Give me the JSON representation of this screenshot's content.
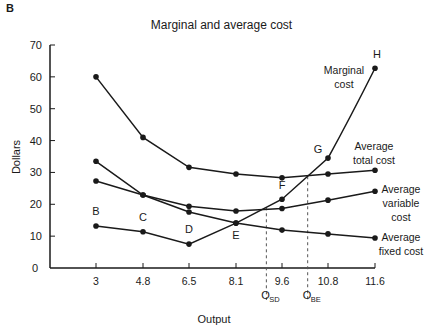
{
  "panel_label": "B",
  "chart_data": {
    "type": "line",
    "title": "Marginal and average cost",
    "xlabel": "Output",
    "ylabel": "Dollars",
    "categories": [
      "3",
      "4.8",
      "6.5",
      "8.1",
      "9.6",
      "10.8",
      "11.6"
    ],
    "x": [
      3,
      4.8,
      6.5,
      8.1,
      9.6,
      10.8,
      11.6
    ],
    "ylim": [
      0,
      70
    ],
    "yticks": [
      0,
      10,
      20,
      30,
      40,
      50,
      60,
      70
    ],
    "grid": false,
    "legend_position": "inline-right",
    "series": [
      {
        "name": "Marginal cost",
        "values": [
          13.2,
          11.4,
          7.5,
          14.1,
          21.6,
          34.5,
          62.7
        ],
        "point_labels": [
          "B",
          "C",
          "D",
          "E",
          "F",
          "G",
          "H"
        ]
      },
      {
        "name": "Average total cost",
        "values": [
          60.0,
          41.0,
          31.6,
          29.5,
          28.3,
          29.5,
          30.7
        ]
      },
      {
        "name": "Average variable cost",
        "values": [
          27.3,
          22.9,
          19.4,
          17.9,
          18.7,
          21.3,
          24.1
        ]
      },
      {
        "name": "Average fixed cost",
        "values": [
          33.5,
          22.9,
          17.6,
          14.1,
          11.9,
          10.7,
          9.4
        ]
      }
    ],
    "annotations": [
      {
        "label": "O",
        "subscript": "SD",
        "x": 9.09,
        "style": "dashed-vertical",
        "meets": "Marginal cost = Average variable cost"
      },
      {
        "label": "O",
        "subscript": "BE",
        "x": 10.27,
        "style": "dashed-vertical",
        "meets": "Marginal cost = Average total cost"
      }
    ],
    "series_labels": {
      "mc": [
        "Marginal",
        "cost"
      ],
      "atc": [
        "Average",
        "total cost"
      ],
      "avc": [
        "Average",
        "variable",
        "cost"
      ],
      "afc": [
        "Average",
        "fixed cost"
      ]
    }
  }
}
